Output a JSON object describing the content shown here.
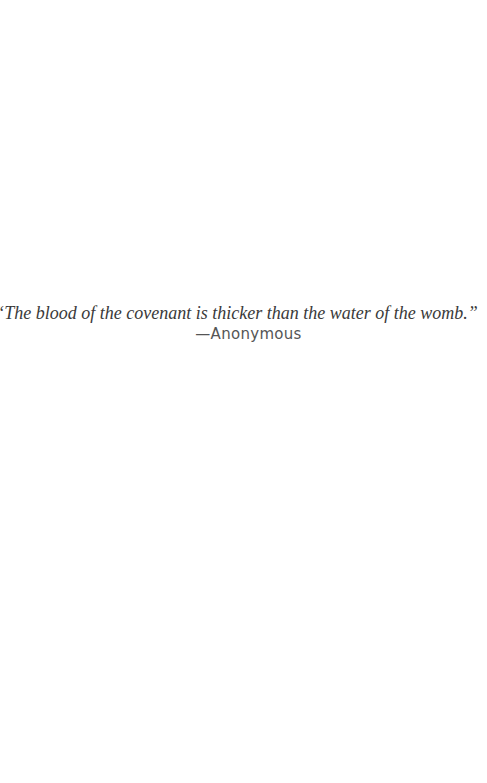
{
  "epigraph": {
    "quote": "“The blood of the covenant is thicker than the water of the womb.”",
    "attribution": "—Anonymous"
  }
}
